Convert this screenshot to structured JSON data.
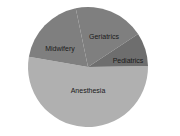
{
  "chart_data": {
    "type": "pie",
    "title": "",
    "categories": [
      "Anesthesia",
      "Midwifery",
      "Geriatrics",
      "Pediatrics"
    ],
    "values": [
      53,
      19,
      19,
      9
    ],
    "colors": [
      "#b0b0b0",
      "#7f7f7f",
      "#7f7f7f",
      "#6e6e6e"
    ],
    "start_angle_deg": -1,
    "direction": "clockwise",
    "legend": "none",
    "labels_inside": true
  },
  "labels": {
    "anesthesia": "Anesthesia",
    "midwifery": "Midwifery",
    "geriatrics": "Geriatrics",
    "pediatrics": "Pediatrics"
  }
}
